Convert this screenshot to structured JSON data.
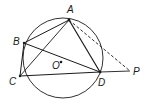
{
  "diagram": {
    "type": "geometry",
    "stroke_color": "#1a1a1a",
    "circle": {
      "cx": 62,
      "cy": 58,
      "r": 40
    },
    "points": {
      "A": {
        "x": 69,
        "y": 20,
        "label": "A",
        "lx": 70,
        "ly": 13
      },
      "B": {
        "x": 24,
        "y": 43,
        "label": "B",
        "lx": 14,
        "ly": 42
      },
      "C": {
        "x": 20,
        "y": 76,
        "label": "C",
        "lx": 9,
        "ly": 83
      },
      "D": {
        "x": 100,
        "y": 72,
        "label": "D",
        "lx": 101,
        "ly": 84
      },
      "P": {
        "x": 130,
        "y": 71,
        "label": "P",
        "lx": 134,
        "ly": 74
      },
      "O": {
        "x": 61,
        "y": 62,
        "label": "O",
        "lx": 52,
        "ly": 68
      }
    },
    "segments": [
      "AB",
      "BC",
      "CD",
      "DA",
      "AC",
      "BD",
      "DP"
    ],
    "dashed_segments": [
      "AP"
    ],
    "labels": {
      "A": "A",
      "B": "B",
      "C": "C",
      "D": "D",
      "P": "P",
      "O": "O"
    }
  }
}
